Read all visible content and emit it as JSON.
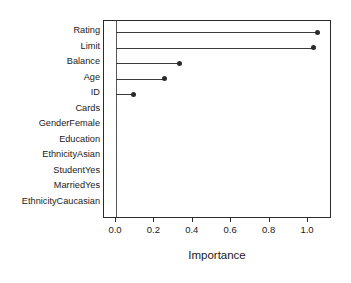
{
  "chart_data": {
    "type": "bar",
    "subtype": "lollipop-dot-plot",
    "orientation": "horizontal",
    "title": "",
    "xlabel": "Importance",
    "ylabel": "",
    "xlim": [
      -0.03,
      1.12
    ],
    "xticks": [
      0.0,
      0.2,
      0.4,
      0.6,
      0.8,
      1.0
    ],
    "xticklabels": [
      "0.0",
      "0.2",
      "0.4",
      "0.6",
      "0.8",
      "1.0"
    ],
    "grid": false,
    "legend": null,
    "baseline": 0.0,
    "categories": [
      "Rating",
      "Limit",
      "Balance",
      "Age",
      "ID",
      "Cards",
      "GenderFemale",
      "Education",
      "EthnicityAsian",
      "StudentYes",
      "MarriedYes",
      "EthnicityCaucasian"
    ],
    "values": [
      1.05,
      1.03,
      0.33,
      0.25,
      0.09,
      0.0,
      0.0,
      0.0,
      0.0,
      0.0,
      0.0,
      0.0
    ],
    "series": [
      {
        "name": "Importance",
        "values": [
          1.05,
          1.03,
          0.33,
          0.25,
          0.09,
          0.0,
          0.0,
          0.0,
          0.0,
          0.0,
          0.0,
          0.0
        ]
      }
    ],
    "point_color": "#2b2b2b",
    "line_color": "#3a3a3a",
    "axis_color": "#2b2b2b",
    "background": "#ffffff"
  }
}
